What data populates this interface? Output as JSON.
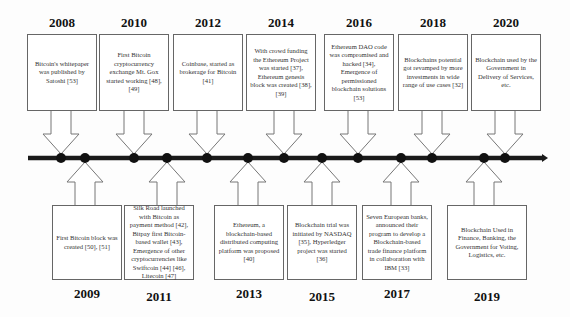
{
  "diagram": {
    "type": "timeline",
    "axis": {
      "start_x": 28,
      "end_x": 548,
      "y": 158,
      "color": "#1a1a1a"
    },
    "top_events": [
      {
        "year": "2008",
        "text": "Bitcoin's whitepaper was published by Satoshi [53]",
        "dot_x": 61,
        "box_x": 27
      },
      {
        "year": "2010",
        "text": "First Bitcoin cryptocurrency exchange Mt. Gox started working [48], [49]",
        "dot_x": 134,
        "box_x": 99
      },
      {
        "year": "2012",
        "text": "Coinbase, started as brokerage for Bitcoin [41]",
        "dot_x": 207,
        "box_x": 173
      },
      {
        "year": "2014",
        "text": "With crowd funding the Ethereum Project was started [37], Ethereum genesis block was created [38], [39]",
        "dot_x": 284,
        "box_x": 246
      },
      {
        "year": "2016",
        "text": "Ethereum DAO code was compromised and hacked [34], Emergence of permissioned blockchain solutions [53]",
        "dot_x": 358,
        "box_x": 324
      },
      {
        "year": "2018",
        "text": "Blockchains potential got revamped by more investments in wide range of use cases [32]",
        "dot_x": 432,
        "box_x": 398
      },
      {
        "year": "2020",
        "text": "Blockchain used by the Government in Delivery of Services, etc.",
        "dot_x": 505,
        "box_x": 471
      }
    ],
    "bottom_events": [
      {
        "year": "2009",
        "text": "First Bitcoin block was created [50], [51]",
        "dot_x": 85,
        "box_x": 52
      },
      {
        "year": "2011",
        "text": "Silk Road launched with Bitcoin as payment method [42], Bitpay first Bitcoin-based wallet [43], Emergence of other cryptocurrencies like Swiftcoin [44] [46], Litecoin [47]",
        "dot_x": 167,
        "box_x": 124
      },
      {
        "year": "2013",
        "text": "Ethereum, a blockchain-based distributed computing platform was proposed [40]",
        "dot_x": 248,
        "box_x": 214
      },
      {
        "year": "2015",
        "text": "Blockchain trial was initiated by NASDAQ [35], Hyperledger project was started [36]",
        "dot_x": 322,
        "box_x": 287
      },
      {
        "year": "2017",
        "text": "Seven European banks, announced their program to develop a Blockchain-based trade finance platform in collaboration with IBM [33]",
        "dot_x": 401,
        "box_x": 362
      },
      {
        "year": "2019",
        "text": "Blockchain Used in Finance, Banking, the Government for Voting, Logistics, etc.",
        "dot_x": 484,
        "box_x": 447
      }
    ]
  }
}
